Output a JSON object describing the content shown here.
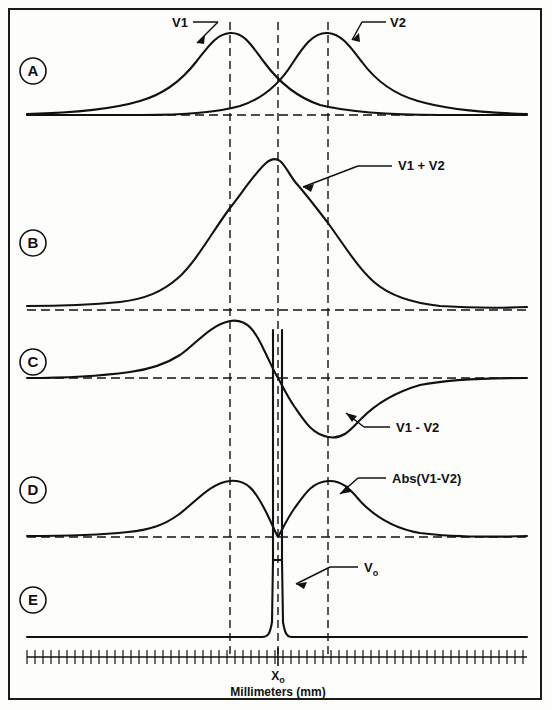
{
  "figure": {
    "title": "",
    "axis_label": "Millimeters (mm)",
    "origin_label": "X",
    "origin_label_sub": "o",
    "border_color": "#1a1a1a",
    "curve_color": "#111111",
    "background_color": "#fdfdfc"
  },
  "panels": [
    {
      "id": "A",
      "letter": "A",
      "labels": [
        {
          "key": "v1",
          "text": "V1"
        },
        {
          "key": "v2",
          "text": "V2"
        }
      ]
    },
    {
      "id": "B",
      "letter": "B",
      "labels": [
        {
          "key": "sum",
          "text": "V1 + V2"
        }
      ]
    },
    {
      "id": "C",
      "letter": "C",
      "labels": [
        {
          "key": "diff",
          "text": "V1 - V2"
        }
      ]
    },
    {
      "id": "D",
      "letter": "D",
      "labels": [
        {
          "key": "abs",
          "text": "Abs(V1-V2)"
        }
      ]
    },
    {
      "id": "E",
      "letter": "E",
      "labels": [
        {
          "key": "vo",
          "text": "V",
          "sub": "o"
        }
      ]
    }
  ],
  "markers": {
    "v1_peak_label": "V1",
    "v2_peak_label": "V2",
    "sum_label": "V1 + V2",
    "diff_label": "V1 - V2",
    "abs_label": "Abs(V1-V2)",
    "vo_label": "V",
    "vo_sub": "o",
    "x0_label": "X",
    "x0_sub": "o"
  },
  "chart_data": {
    "type": "line",
    "title": "",
    "xlabel": "Millimeters (mm)",
    "ylabel": "",
    "grid": false,
    "legend": "inline-annotations",
    "axis_ticks": {
      "count": 62,
      "spacing_px": 8,
      "x_start_px": 27,
      "x_end_px": 527,
      "labeled_ticks": [
        "X_o"
      ]
    },
    "reference_lines": {
      "vertical_dashed_mm": [
        -6,
        0,
        6
      ],
      "vertical_dashed_px": [
        230,
        278,
        328
      ],
      "description": "Left line = V1 peak position, center line = X_o (crossover / origin), right line = V2 peak position"
    },
    "x_domain_px": [
      27,
      527
    ],
    "x_domain_mm": [
      -31,
      31
    ],
    "series": [
      {
        "name": "V1",
        "panel": "A",
        "type": "asymmetric-peak",
        "peak_x_mm": -6,
        "peak_value": 1.0,
        "baseline": 0,
        "note": "Broad asymmetric gaussian-like lobe, long tail to the left, peak at left dashed line"
      },
      {
        "name": "V2",
        "panel": "A",
        "type": "asymmetric-peak",
        "peak_x_mm": 6,
        "peak_value": 1.0,
        "baseline": 0,
        "note": "Mirror image of V1, long tail to the right, peak at right dashed line; V1 and V2 cross at X_o"
      },
      {
        "name": "V1 + V2",
        "panel": "B",
        "type": "sum",
        "peak_x_mm": 0,
        "peak_value": 1.35,
        "baseline": 0,
        "note": "Sum of V1 and V2, single broad maximum centered at X_o with slight shoulder"
      },
      {
        "name": "V1 - V2",
        "panel": "C",
        "type": "dispersive",
        "positive_peak_x_mm": -6,
        "positive_peak_value": 1.0,
        "zero_crossing_x_mm": 0,
        "negative_peak_x_mm": 6,
        "negative_peak_value": -0.95,
        "baseline": 0,
        "note": "Difference signal: positive lobe left of X_o, steep zero crossing exactly at X_o, negative lobe right of X_o"
      },
      {
        "name": "Abs(V1-V2)",
        "panel": "D",
        "type": "rectified",
        "peak_positions_mm": [
          -6,
          6
        ],
        "peak_values": [
          1.0,
          1.0
        ],
        "minimum_x_mm": 0,
        "minimum_value": 0.0,
        "baseline": 0,
        "note": "Rectified difference: two lobes separated by a deep null at X_o"
      },
      {
        "name": "Vo",
        "panel": "E",
        "type": "impulse",
        "spike_x_mm": 0,
        "spike_value": 1.0,
        "spike_width_mm": 0.5,
        "baseline": 0.02,
        "note": "Very narrow impulse located exactly at X_o, flat elsewhere"
      }
    ]
  }
}
